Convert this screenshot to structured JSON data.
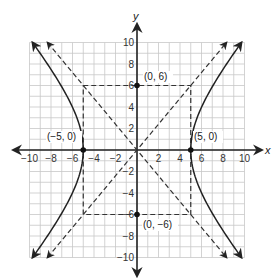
{
  "chart_data": {
    "type": "line",
    "title": "",
    "xlabel": "x",
    "ylabel": "y",
    "xlim": [
      -10,
      10
    ],
    "ylim": [
      -10,
      10
    ],
    "grid": true,
    "grid_step": 1,
    "x_ticks": [
      -10,
      -8,
      -6,
      -4,
      -2,
      2,
      4,
      6,
      8,
      10
    ],
    "y_ticks": [
      -10,
      -8,
      -6,
      -4,
      -2,
      2,
      4,
      6,
      8,
      10
    ],
    "x_tick_labels": [
      "−10",
      "−8",
      "−6",
      "−4",
      "−2",
      "2",
      "4",
      "6",
      "8",
      "10"
    ],
    "y_tick_labels": [
      "−10",
      "−8",
      "−6",
      "−4",
      "−2",
      "2",
      "4",
      "6",
      "8",
      "10"
    ],
    "equation": "x^2/25 - y^2/36 = 1",
    "series": [
      {
        "name": "hyperbola-right-branch",
        "style": "solid",
        "points": [
          [
            9.72,
            -10
          ],
          [
            7.81,
            -6
          ],
          [
            6.01,
            -2
          ],
          [
            5,
            0
          ],
          [
            6.01,
            2
          ],
          [
            7.81,
            6
          ],
          [
            9.72,
            10
          ]
        ]
      },
      {
        "name": "hyperbola-left-branch",
        "style": "solid",
        "points": [
          [
            -9.72,
            -10
          ],
          [
            -7.81,
            -6
          ],
          [
            -6.01,
            -2
          ],
          [
            -5,
            0
          ],
          [
            -6.01,
            2
          ],
          [
            -7.81,
            6
          ],
          [
            -9.72,
            10
          ]
        ]
      },
      {
        "name": "asymptote-positive",
        "style": "dashed",
        "equation": "y = (6/5)x",
        "points": [
          [
            -8.33,
            -10
          ],
          [
            8.33,
            10
          ]
        ]
      },
      {
        "name": "asymptote-negative",
        "style": "dashed",
        "equation": "y = -(6/5)x",
        "points": [
          [
            -8.33,
            10
          ],
          [
            8.33,
            -10
          ]
        ]
      },
      {
        "name": "central-rectangle",
        "style": "dashed",
        "points": [
          [
            -5,
            6
          ],
          [
            5,
            6
          ],
          [
            5,
            -6
          ],
          [
            -5,
            -6
          ],
          [
            -5,
            6
          ]
        ]
      }
    ],
    "labeled_points": [
      {
        "x": -5,
        "y": 0,
        "label": "(−5, 0)"
      },
      {
        "x": 5,
        "y": 0,
        "label": "(5, 0)"
      },
      {
        "x": 0,
        "y": 6,
        "label": "(0, 6)"
      },
      {
        "x": 0,
        "y": -6,
        "label": "(0, −6)"
      }
    ]
  },
  "labels": {
    "x_axis": "x",
    "y_axis": "y",
    "p_left": "(−5, 0)",
    "p_right": "(5, 0)",
    "p_top": "(0, 6)",
    "p_bottom": "(0, −6)",
    "xt": [
      "−10",
      "−8",
      "−6",
      "−4",
      "−2",
      "2",
      "4",
      "6",
      "8",
      "10"
    ],
    "yt": [
      "10",
      "8",
      "6",
      "4",
      "2",
      "−2",
      "−4",
      "−6",
      "−8",
      "−10"
    ]
  },
  "colors": {
    "grid": "#c8c8c8",
    "axis": "#222222",
    "curve": "#222222",
    "dashed": "#333333"
  }
}
